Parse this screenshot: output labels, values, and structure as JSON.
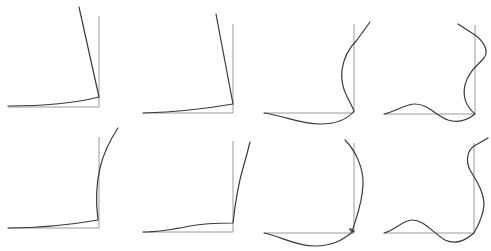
{
  "figure": {
    "width": 491,
    "height": 251,
    "background": "#ffffff",
    "axis_color": "#9a9a9a",
    "curve_color": "#3a3a3a",
    "panels": [
      {
        "id": "mode-1-row-1",
        "axes": "M8,107 L99,107 L99,16",
        "curve": "M8,106 C40,106 75,103 99,97 L79,7"
      },
      {
        "id": "mode-2-row-1",
        "axes": "M143,113 L233,113 L233,24",
        "curve": "M143,113 C175,112 210,108 233,104 L216,14"
      },
      {
        "id": "mode-3-row-1",
        "axes": "M264,113 L354,113 L354,24",
        "curve": "M264,113 C285,116 300,124 320,124 C340,124 350,116 354,111 C350,100 340,90 342,70 C344,55 352,45 357,40 L370,22"
      },
      {
        "id": "mode-4-row-1",
        "axes": "M384,114 L475,114 L475,25",
        "curve": "M384,114 C395,112 405,104 415,104 C428,104 435,115 448,120 C460,124 470,118 475,114 C468,108 462,98 465,85 C468,72 478,65 484,58 C490,50 482,40 475,35 L458,24"
      },
      {
        "id": "mode-1-row-2",
        "axes": "M8,228 L99,228 L99,137",
        "curve": "M8,228 C40,228 75,224 98,220 C96,205 96,185 100,168 C103,155 110,140 118,128"
      },
      {
        "id": "mode-2-row-2",
        "axes": "M143,232 L233,232 L233,141",
        "curve": "M143,232 C160,232 175,229 190,226 C205,223 220,223 233,223 C235,205 238,185 243,168 C246,158 248,150 250,142"
      },
      {
        "id": "mode-3-row-2",
        "axes": "M264,233 L354,233 L354,143",
        "curve": "M264,233 C280,236 295,246 315,246 C335,246 345,238 354,231 C350,228 348,228 352,232 C356,218 362,205 363,185 C364,168 355,150 345,140"
      },
      {
        "id": "mode-4-row-2",
        "axes": "M384,233 L474,233 L474,143",
        "curve": "M384,233 C395,230 403,220 412,220 C424,220 432,232 445,240 C458,246 468,238 474,233 C478,225 483,218 484,205 C484,192 476,180 470,170 C465,160 468,150 474,146 L488,138"
      }
    ]
  }
}
